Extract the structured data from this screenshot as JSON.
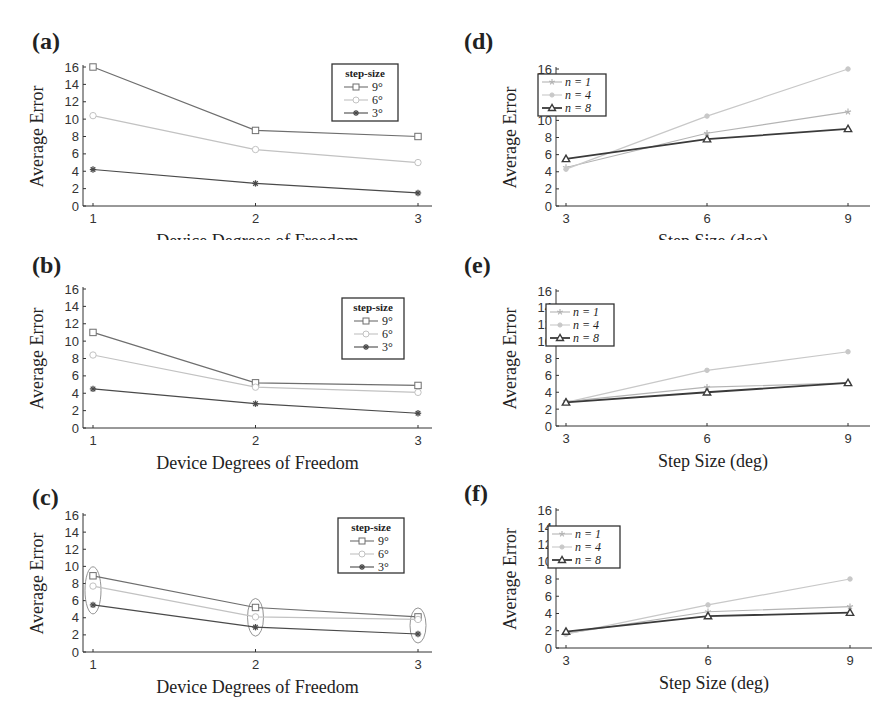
{
  "chart_data": [
    {
      "id": "a",
      "panel_label": "(a)",
      "type": "line",
      "title": "",
      "xlabel": "Device Degrees of Freedom",
      "ylabel": "Average Error",
      "x": [
        1,
        2,
        3
      ],
      "xticks": [
        "1",
        "2",
        "3"
      ],
      "ylim": [
        0,
        16
      ],
      "yticks": [
        0,
        2,
        4,
        6,
        8,
        10,
        12,
        14,
        16
      ],
      "grid": false,
      "legend_title": "step-size",
      "legend_position": "upper right",
      "series": [
        {
          "name": "9°",
          "marker": "square",
          "color": "#6e6e6e",
          "values": [
            16,
            8.7,
            8.0
          ]
        },
        {
          "name": "6°",
          "marker": "circle",
          "color": "#c2c2c2",
          "values": [
            10.4,
            6.5,
            5.0
          ]
        },
        {
          "name": "3°",
          "marker": "asterisk",
          "color": "#4a4a4a",
          "values": [
            4.2,
            2.6,
            1.5
          ]
        }
      ],
      "annotations": []
    },
    {
      "id": "b",
      "panel_label": "(b)",
      "type": "line",
      "title": "",
      "xlabel": "Device Degrees of Freedom",
      "ylabel": "Average Error",
      "x": [
        1,
        2,
        3
      ],
      "xticks": [
        "1",
        "2",
        "3"
      ],
      "ylim": [
        0,
        16
      ],
      "yticks": [
        0,
        2,
        4,
        6,
        8,
        10,
        12,
        14,
        16
      ],
      "grid": false,
      "legend_title": "step-size",
      "legend_position": "upper right",
      "series": [
        {
          "name": "9°",
          "marker": "square",
          "color": "#6e6e6e",
          "values": [
            11.0,
            5.2,
            4.9
          ]
        },
        {
          "name": "6°",
          "marker": "circle",
          "color": "#c2c2c2",
          "values": [
            8.4,
            4.7,
            4.1
          ]
        },
        {
          "name": "3°",
          "marker": "asterisk",
          "color": "#4a4a4a",
          "values": [
            4.5,
            2.8,
            1.7
          ]
        }
      ],
      "annotations": []
    },
    {
      "id": "c",
      "panel_label": "(c)",
      "type": "line",
      "title": "",
      "xlabel": "Device Degrees of Freedom",
      "ylabel": "Average Error",
      "x": [
        1,
        2,
        3
      ],
      "xticks": [
        "1",
        "2",
        "3"
      ],
      "ylim": [
        0,
        16
      ],
      "yticks": [
        0,
        2,
        4,
        6,
        8,
        10,
        12,
        14,
        16
      ],
      "grid": false,
      "legend_title": "step-size",
      "legend_position": "upper right",
      "series": [
        {
          "name": "9°",
          "marker": "square",
          "color": "#6e6e6e",
          "values": [
            8.9,
            5.2,
            4.1
          ]
        },
        {
          "name": "6°",
          "marker": "circle",
          "color": "#c2c2c2",
          "values": [
            7.7,
            4.1,
            3.8
          ]
        },
        {
          "name": "3°",
          "marker": "asterisk",
          "color": "#4a4a4a",
          "values": [
            5.5,
            2.9,
            2.1
          ]
        }
      ],
      "annotations": [
        "ellipse grouping points at x=1",
        "ellipse grouping points at x=2",
        "ellipse grouping points at x=3"
      ]
    },
    {
      "id": "d",
      "panel_label": "(d)",
      "type": "line",
      "title": "",
      "xlabel": "Step Size (deg)",
      "ylabel": "Average Error",
      "x": [
        3,
        6,
        9
      ],
      "xticks": [
        "3",
        "6",
        "9"
      ],
      "ylim": [
        0,
        16
      ],
      "yticks": [
        0,
        2,
        4,
        6,
        8,
        10,
        12,
        14,
        16
      ],
      "grid": false,
      "legend_title": "",
      "legend_position": "upper left",
      "series": [
        {
          "name": "n = 1",
          "marker": "star",
          "color": "#b4b4b4",
          "values": [
            4.5,
            8.5,
            11.0
          ]
        },
        {
          "name": "n = 4",
          "marker": "dot",
          "color": "#c8c8c8",
          "values": [
            4.3,
            10.5,
            16.0
          ]
        },
        {
          "name": "n = 8",
          "marker": "triangle",
          "color": "#3a3a3a",
          "values": [
            5.5,
            7.8,
            9.0
          ]
        }
      ],
      "annotations": []
    },
    {
      "id": "e",
      "panel_label": "(e)",
      "type": "line",
      "title": "",
      "xlabel": "Step Size (deg)",
      "ylabel": "Average Error",
      "x": [
        3,
        6,
        9
      ],
      "xticks": [
        "3",
        "6",
        "9"
      ],
      "ylim": [
        0,
        16
      ],
      "yticks": [
        0,
        2,
        4,
        6,
        8,
        10,
        12,
        14,
        16
      ],
      "grid": false,
      "legend_title": "",
      "legend_position": "upper left",
      "series": [
        {
          "name": "n = 1",
          "marker": "star",
          "color": "#b4b4b4",
          "values": [
            2.9,
            4.6,
            5.1
          ]
        },
        {
          "name": "n = 4",
          "marker": "dot",
          "color": "#c8c8c8",
          "values": [
            2.8,
            6.6,
            8.8
          ]
        },
        {
          "name": "n = 8",
          "marker": "triangle",
          "color": "#3a3a3a",
          "values": [
            2.8,
            4.0,
            5.1
          ]
        }
      ],
      "annotations": []
    },
    {
      "id": "f",
      "panel_label": "(f)",
      "type": "line",
      "title": "",
      "xlabel": "Step Size (deg)",
      "ylabel": "Average Error",
      "x": [
        3,
        6,
        9
      ],
      "xticks": [
        "3",
        "6",
        "9"
      ],
      "ylim": [
        0,
        16
      ],
      "yticks": [
        0,
        2,
        4,
        6,
        8,
        10,
        12,
        14,
        16
      ],
      "grid": false,
      "legend_title": "",
      "legend_position": "upper left",
      "series": [
        {
          "name": "n = 1",
          "marker": "star",
          "color": "#b4b4b4",
          "values": [
            1.7,
            4.2,
            4.8
          ]
        },
        {
          "name": "n = 4",
          "marker": "dot",
          "color": "#c8c8c8",
          "values": [
            1.6,
            5.0,
            8.0
          ]
        },
        {
          "name": "n = 8",
          "marker": "triangle",
          "color": "#3a3a3a",
          "values": [
            1.9,
            3.7,
            4.1
          ]
        }
      ],
      "annotations": []
    }
  ],
  "layout": {
    "panels": [
      {
        "id": "a",
        "left": 0,
        "top": 0,
        "plot": {
          "x0": 83,
          "x1": 432,
          "y0": 67,
          "y1": 206
        },
        "legend": {
          "x": 332,
          "y": 64,
          "w": 66,
          "h": 57
        },
        "label": {
          "x": 32,
          "y": 28
        }
      },
      {
        "id": "b",
        "left": 0,
        "top": 240,
        "plot": {
          "x0": 83,
          "x1": 432,
          "y0": 49,
          "y1": 188
        },
        "legend": {
          "x": 342,
          "y": 58,
          "w": 62,
          "h": 61
        },
        "label": {
          "x": 32,
          "y": 12
        }
      },
      {
        "id": "c",
        "left": 0,
        "top": 480,
        "plot": {
          "x0": 83,
          "x1": 432,
          "y0": 35,
          "y1": 172
        },
        "legend": {
          "x": 338,
          "y": 38,
          "w": 66,
          "h": 55
        },
        "label": {
          "x": 32,
          "y": 4
        }
      },
      {
        "id": "d",
        "left": 440,
        "top": 0,
        "plot": {
          "x0": 116,
          "x1": 430,
          "y0": 69,
          "y1": 206
        },
        "legend": {
          "x": 98,
          "y": 74,
          "w": 68,
          "h": 42
        },
        "label": {
          "x": 24,
          "y": 28
        }
      },
      {
        "id": "e",
        "left": 440,
        "top": 240,
        "plot": {
          "x0": 116,
          "x1": 430,
          "y0": 51,
          "y1": 186
        },
        "legend": {
          "x": 106,
          "y": 64,
          "w": 68,
          "h": 42
        },
        "label": {
          "x": 24,
          "y": 12
        }
      },
      {
        "id": "f",
        "left": 440,
        "top": 480,
        "plot": {
          "x0": 116,
          "x1": 432,
          "y0": 30,
          "y1": 168
        },
        "legend": {
          "x": 108,
          "y": 46,
          "w": 72,
          "h": 42
        },
        "label": {
          "x": 24,
          "y": 0
        }
      }
    ]
  }
}
